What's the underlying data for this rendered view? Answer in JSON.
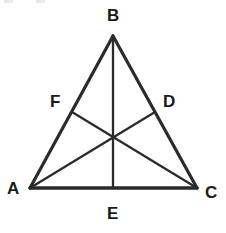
{
  "figure": {
    "kind": "geometry-diagram",
    "canvas": {
      "width": 226,
      "height": 233,
      "background": "#ffffff"
    },
    "stroke": {
      "color": "#2b2b2b",
      "width": 2.6,
      "base_width": 3.4
    },
    "label_color": "#1a1a1a"
  },
  "labels": {
    "vertex_b": "B",
    "vertex_a": "A",
    "vertex_c": "C",
    "point_f": "F",
    "point_d": "D",
    "point_e": "E"
  },
  "geometry": {
    "vertices": [
      {
        "name": "A",
        "x": 30,
        "y": 188
      },
      {
        "name": "B",
        "x": 113,
        "y": 36
      },
      {
        "name": "C",
        "x": 197,
        "y": 188
      }
    ],
    "midpoints": [
      {
        "name": "F",
        "on": "AB",
        "x": 72,
        "y": 112
      },
      {
        "name": "D",
        "on": "BC",
        "x": 155,
        "y": 112
      },
      {
        "name": "E",
        "on": "AC",
        "x": 113,
        "y": 188
      }
    ],
    "centroid": {
      "x": 113,
      "y": 138
    },
    "sides": [
      {
        "name": "AB",
        "from": "A",
        "to": "B"
      },
      {
        "name": "BC",
        "from": "B",
        "to": "C"
      },
      {
        "name": "AC",
        "from": "A",
        "to": "C"
      }
    ],
    "medians": [
      {
        "name": "BE",
        "from": "B",
        "to": "E"
      },
      {
        "name": "AD",
        "from": "A",
        "to": "D"
      },
      {
        "name": "CF",
        "from": "C",
        "to": "F"
      }
    ]
  },
  "label_positions": {
    "vertex_b": {
      "left": 107,
      "top": 7
    },
    "vertex_a": {
      "left": 7,
      "top": 180
    },
    "vertex_c": {
      "left": 205,
      "top": 184
    },
    "point_f": {
      "left": 50,
      "top": 93
    },
    "point_d": {
      "left": 163,
      "top": 93
    },
    "point_e": {
      "left": 107,
      "top": 205
    }
  }
}
